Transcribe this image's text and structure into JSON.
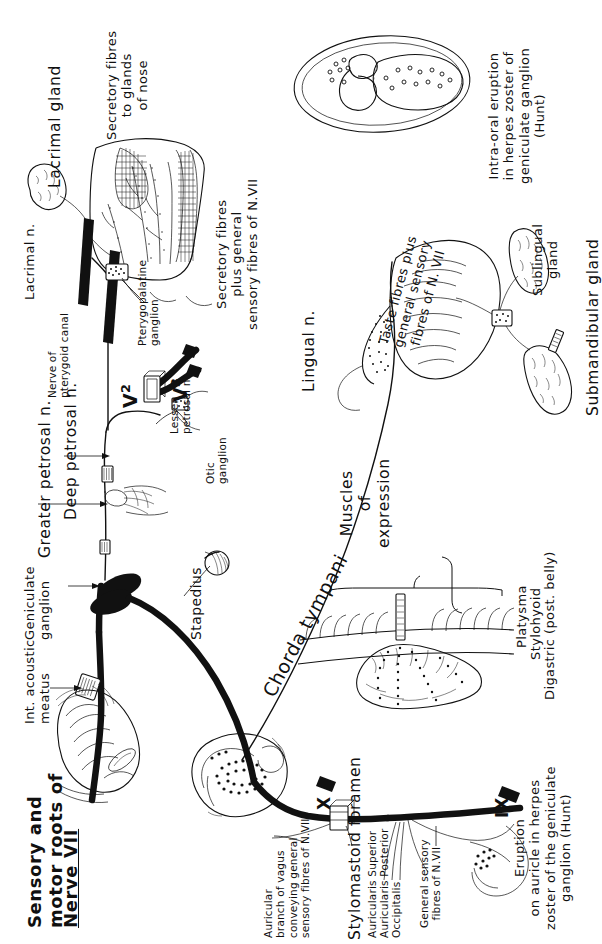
{
  "figure": {
    "orientation": "labels rotated 90 degrees, reading bottom-to-top",
    "ink_color": "#111111",
    "background_color": "#ffffff"
  },
  "labels": {
    "lacrimal_gland": "Lacrimal gland",
    "lacrimal_n": "Lacrimal n.",
    "secretory_fibres_nose": "Secretory fibres\nto glands\nof nose",
    "greater_petrosal_n": "Greater petrosal n.",
    "deep_petrosal_n": "Deep petrosal n.",
    "geniculate_ganglion": "Geniculate\nganglion",
    "int_acoustic_meatus": "Int. acoustic\nmeatus",
    "sensory_motor_roots": "Sensory and\nmotor roots of",
    "nerve_vii_underlined": "Nerve VII",
    "nerve_of_pterygoid_canal": "Nerve of\npterygoid canal",
    "pterygopalatine_ganglion": "Pterygopalatine\nganglion",
    "lesser_petrosal_n": "Lesser\npetrosal n.",
    "lesser_petrosal_dash": "—",
    "otic_ganglion": "Otic\nganglion",
    "v2": "V",
    "v2_sup": "2",
    "v3": "V",
    "v3_sup": "3",
    "secretory_plus_general": "Secretory fibres\nplus general\nsensory fibres of N.VII",
    "lingual_n": "Lingual n.",
    "taste_fibres": "Taste fibres plus\ngeneral sensory\nfibres of N. VII",
    "sublingual_gland": "Sublingual\ngland",
    "submandibular_gland": "Submandibular gland",
    "intraoral_eruption": "Intra-oral eruption\nin herpes zoster of\ngeniculate ganglion\n(Hunt)",
    "chorda_tympani": "Chorda tympani",
    "stapedius": "Stapedius",
    "muscles_of_expression": "Muscles\nof\nexpression",
    "platysma": "Platysma",
    "stylohyoid": "Stylohyoid",
    "digastric": "Digastric (post. belly)",
    "stylomastoid_foramen": "Stylomastoid foramen",
    "auricular_branch_vagus": "Auricular\nbranch of vagus\nconveying general\nsensory fibres of N.VII",
    "auricularis_superior": "Auricularis Superior",
    "auricularis_posterior": "Auricularis Posterior",
    "occipitalis": "Occipitalis",
    "general_sensory_fibres": "General sensory\nfibres of N.VII",
    "eruption_auricle": "Eruption\non auricle in herpes\nzoster of the geniculate\nganglion (Hunt)",
    "cranial_x": "X",
    "cranial_ix": "IX"
  },
  "structures": [
    {
      "name": "lacrimal-gland",
      "kind": "gland"
    },
    {
      "name": "nasal-cavity-mucosa",
      "kind": "mucosa-with-vessels"
    },
    {
      "name": "pterygopalatine-ganglion",
      "kind": "ganglion"
    },
    {
      "name": "geniculate-ganglion",
      "kind": "ganglion"
    },
    {
      "name": "otic-ganglion",
      "kind": "ganglion"
    },
    {
      "name": "submandibular-ganglion",
      "kind": "ganglion"
    },
    {
      "name": "tongue",
      "kind": "organ"
    },
    {
      "name": "sublingual-gland",
      "kind": "gland"
    },
    {
      "name": "submandibular-gland",
      "kind": "gland"
    },
    {
      "name": "stapedius-muscle",
      "kind": "muscle"
    },
    {
      "name": "facial-muscles",
      "kind": "muscle-group"
    },
    {
      "name": "platysma",
      "kind": "muscle"
    },
    {
      "name": "auricle",
      "kind": "external-ear"
    },
    {
      "name": "brainstem-pons",
      "kind": "cns"
    },
    {
      "name": "internal-acoustic-meatus",
      "kind": "foramen"
    },
    {
      "name": "stylomastoid-foramen",
      "kind": "foramen"
    },
    {
      "name": "intra-oral-eruption-drawing",
      "kind": "clinical-inset"
    }
  ]
}
